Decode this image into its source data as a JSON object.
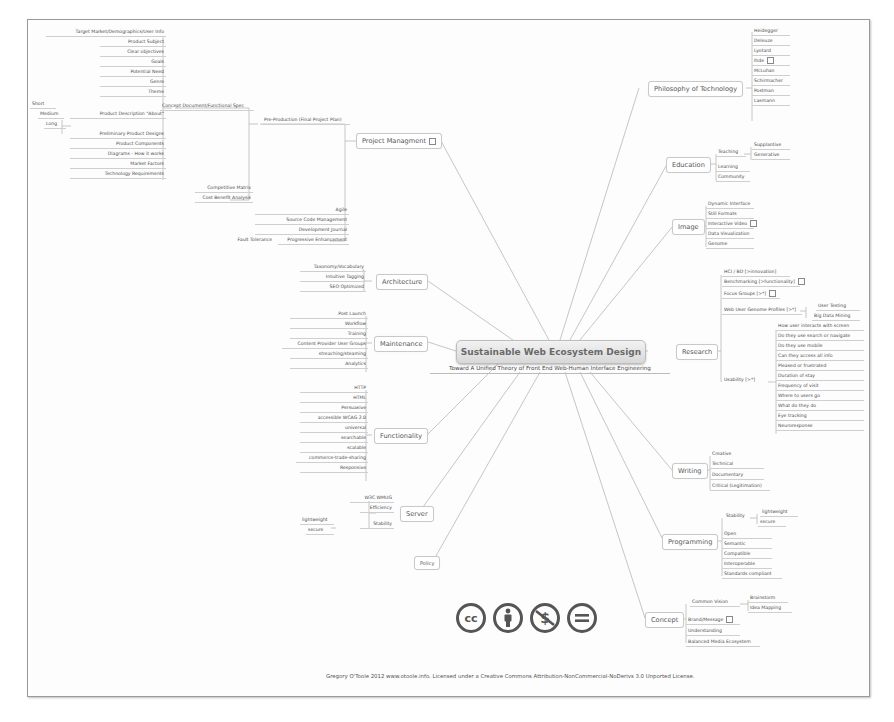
{
  "central": {
    "title": "Sustainable Web Ecosystem Design",
    "subtitle": "Toward A Unified Theory of Front End Web-Human Interface Engineering"
  },
  "branches": {
    "project_management": {
      "label": "Project Managment",
      "preproduction": "Pre-Production (Final Project Plan)",
      "concept_doc": "Concept Document/Functional Spec",
      "concept_children": [
        "Target Market/Demographics/User Info",
        "Product Subject",
        "Clear objectives",
        "Goals",
        "Potential Need",
        "Genre",
        "Theme"
      ],
      "product_description": "Product Description \"About\"",
      "description_lengths": [
        "Short",
        "Medium",
        "Long"
      ],
      "concept_children_2": [
        "Preliminary Product Designs",
        "Product Components",
        "Diagrams - How it works",
        "Market Factors",
        "Technology Requirements"
      ],
      "preproduction_children": [
        "Competitive Matrix",
        "Cost Benefit Analysis"
      ],
      "pm_children": [
        "Agile",
        "Source Code Management",
        "Development Journal",
        "Progressive Enhancement"
      ],
      "fault_tolerance": "Fault Tolerance"
    },
    "architecture": {
      "label": "Architecture",
      "children": [
        "Taxonomy/Vocabulary",
        "Intuitive Tagging",
        "SEO Optimized"
      ]
    },
    "maintenance": {
      "label": "Maintenance",
      "children": [
        "Post Launch",
        "Workflow",
        "Training",
        "Content Provider User Groups",
        "streaching/steaming",
        "Analytics"
      ]
    },
    "functionality": {
      "label": "Functionality",
      "children": [
        "HTTP",
        "HTML",
        "Persuasive",
        "accessible WCAG 2.0",
        "universal",
        "searchable",
        "scalable",
        "commerce-trade-sharing",
        "Responsive"
      ]
    },
    "server": {
      "label": "Server",
      "children": [
        "W3C WMUG",
        "Efficiency",
        "Stability"
      ],
      "stability_children": [
        "lightweight",
        "secure"
      ]
    },
    "policy": {
      "label": "Policy"
    },
    "philosophy": {
      "label": "Philosophy of Technology",
      "children": [
        "Heidegger",
        "Deleuze",
        "Lyotard",
        "Ihde",
        "McLuhan",
        "Schirmacher",
        "Postman",
        "Lasmann"
      ]
    },
    "education": {
      "label": "Education",
      "teaching": "Teaching",
      "teaching_children": [
        "Supplantive",
        "Generative"
      ],
      "children": [
        "Learning",
        "Community"
      ]
    },
    "image": {
      "label": "Image",
      "children": [
        "Dynamic Interface",
        "Still Formats",
        "Interactive Video",
        "Data Visualization",
        "Genome"
      ]
    },
    "research": {
      "label": "Research",
      "children": [
        "HCI / BD [>innovation]",
        "Benchmarking [>functionality]",
        "Focus Groups [>*]",
        "Web User Genome Profiles [>*]"
      ],
      "genome_children": [
        "User Testing",
        "Big Data Mining"
      ],
      "usability": "Usability [>*]",
      "usability_children": [
        "How user interacts with screen",
        "Do they use search or navigate",
        "Do they use mobile",
        "Can they access all info",
        "Pleased or frustrated",
        "Duration of stay",
        "Frequency of visit",
        "Where to users go",
        "What do they do",
        "Eye tracking",
        "Neuroresponse"
      ]
    },
    "writing": {
      "label": "Writing",
      "children": [
        "Creative",
        "Technical",
        "Documentary",
        "Critical (Legitimation)"
      ]
    },
    "programming": {
      "label": "Programming",
      "stability": "Stability",
      "stability_children": [
        "lightweight",
        "secure"
      ],
      "children": [
        "Open",
        "Semantic",
        "Compatible",
        "Interoperable",
        "Standards compliant"
      ]
    },
    "concept": {
      "label": "Concept",
      "common_vision": "Common Vision",
      "vision_children": [
        "Brainstorm",
        "Idea Mapping"
      ],
      "children": [
        "Brand/Message",
        "Understanding",
        "Balanced Media Ecosystem"
      ]
    }
  },
  "license": {
    "icons": [
      "cc-icon",
      "attribution-icon",
      "noncommercial-icon",
      "noderivatives-icon"
    ],
    "cc_text": "cc",
    "nd_text": "=",
    "footer": "Gregory O'Toole 2012 www.otoole.info. Licensed under a Creative Commons Attribution-NonCommercial-NoDerivs 3.0 Unported License."
  },
  "colors": {
    "line": "#b5b5b5",
    "text": "#4a4a4a",
    "central_bg": "#e2e2e2",
    "icon": "#555555"
  }
}
